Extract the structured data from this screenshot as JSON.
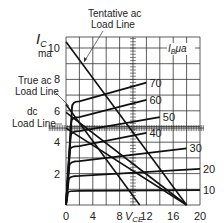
{
  "chart_data": {
    "type": "line",
    "title": "",
    "xlabel": "V_CE",
    "ylabel": "I_C ma",
    "xlim": [
      0,
      20
    ],
    "ylim": [
      0,
      10
    ],
    "x_ticks": [
      "0",
      "4",
      "8",
      "12",
      "16",
      "20"
    ],
    "y_ticks": [
      "2",
      "4",
      "6",
      "8",
      "10"
    ],
    "grid": true,
    "legend_title": "I_B μa",
    "series": [
      {
        "name": "10",
        "points": [
          [
            0,
            0
          ],
          [
            0.3,
            0.8
          ],
          [
            2,
            0.9
          ],
          [
            20,
            0.95
          ]
        ]
      },
      {
        "name": "20",
        "points": [
          [
            0,
            0
          ],
          [
            0.4,
            1.6
          ],
          [
            2,
            1.85
          ],
          [
            20,
            2.3
          ]
        ]
      },
      {
        "name": "30",
        "points": [
          [
            0,
            0
          ],
          [
            0.5,
            2.5
          ],
          [
            2,
            2.8
          ],
          [
            18,
            3.6
          ]
        ]
      },
      {
        "name": "40",
        "points": [
          [
            0,
            0
          ],
          [
            0.6,
            3.5
          ],
          [
            2,
            3.75
          ],
          [
            12,
            4.6
          ]
        ]
      },
      {
        "name": "50",
        "points": [
          [
            0,
            0
          ],
          [
            0.7,
            4.4
          ],
          [
            2,
            4.7
          ],
          [
            14,
            5.6
          ]
        ]
      },
      {
        "name": "60",
        "points": [
          [
            0,
            0
          ],
          [
            0.8,
            5.3
          ],
          [
            2,
            5.6
          ],
          [
            12,
            6.7
          ]
        ]
      },
      {
        "name": "70",
        "points": [
          [
            0,
            0
          ],
          [
            0.9,
            6.2
          ],
          [
            2,
            6.6
          ],
          [
            12,
            7.8
          ]
        ]
      }
    ],
    "load_lines": [
      {
        "name": "Tentative ac Load Line",
        "points": [
          [
            0,
            10.4
          ],
          [
            18,
            0
          ]
        ]
      },
      {
        "name": "True ac Load Line",
        "points": [
          [
            0,
            6.4
          ],
          [
            11,
            0
          ]
        ]
      },
      {
        "name": "dc Load Line",
        "points": [
          [
            0,
            4.9
          ],
          [
            18,
            0
          ]
        ]
      },
      {
        "name": "operating line",
        "points": [
          [
            0,
            5.9
          ],
          [
            18,
            0
          ]
        ]
      }
    ],
    "annotations": [
      "Tentative ac Load Line",
      "True ac Load Line",
      "dc Load Line",
      "I_B μa",
      "70",
      "60",
      "50",
      "40",
      "30",
      "20",
      "10"
    ]
  },
  "labels": {
    "ic": "I",
    "ic_sub": "C",
    "ma": "ma",
    "vce": "V",
    "vce_sub": "CE",
    "ib": "I",
    "ib_sub": "B",
    "ib_unit": "μa",
    "tentative_1": "Tentative ac",
    "tentative_2": "Load Line",
    "true_1": "True ac",
    "true_2": "Load Line",
    "dc_1": "dc",
    "dc_2": "Load Line"
  }
}
